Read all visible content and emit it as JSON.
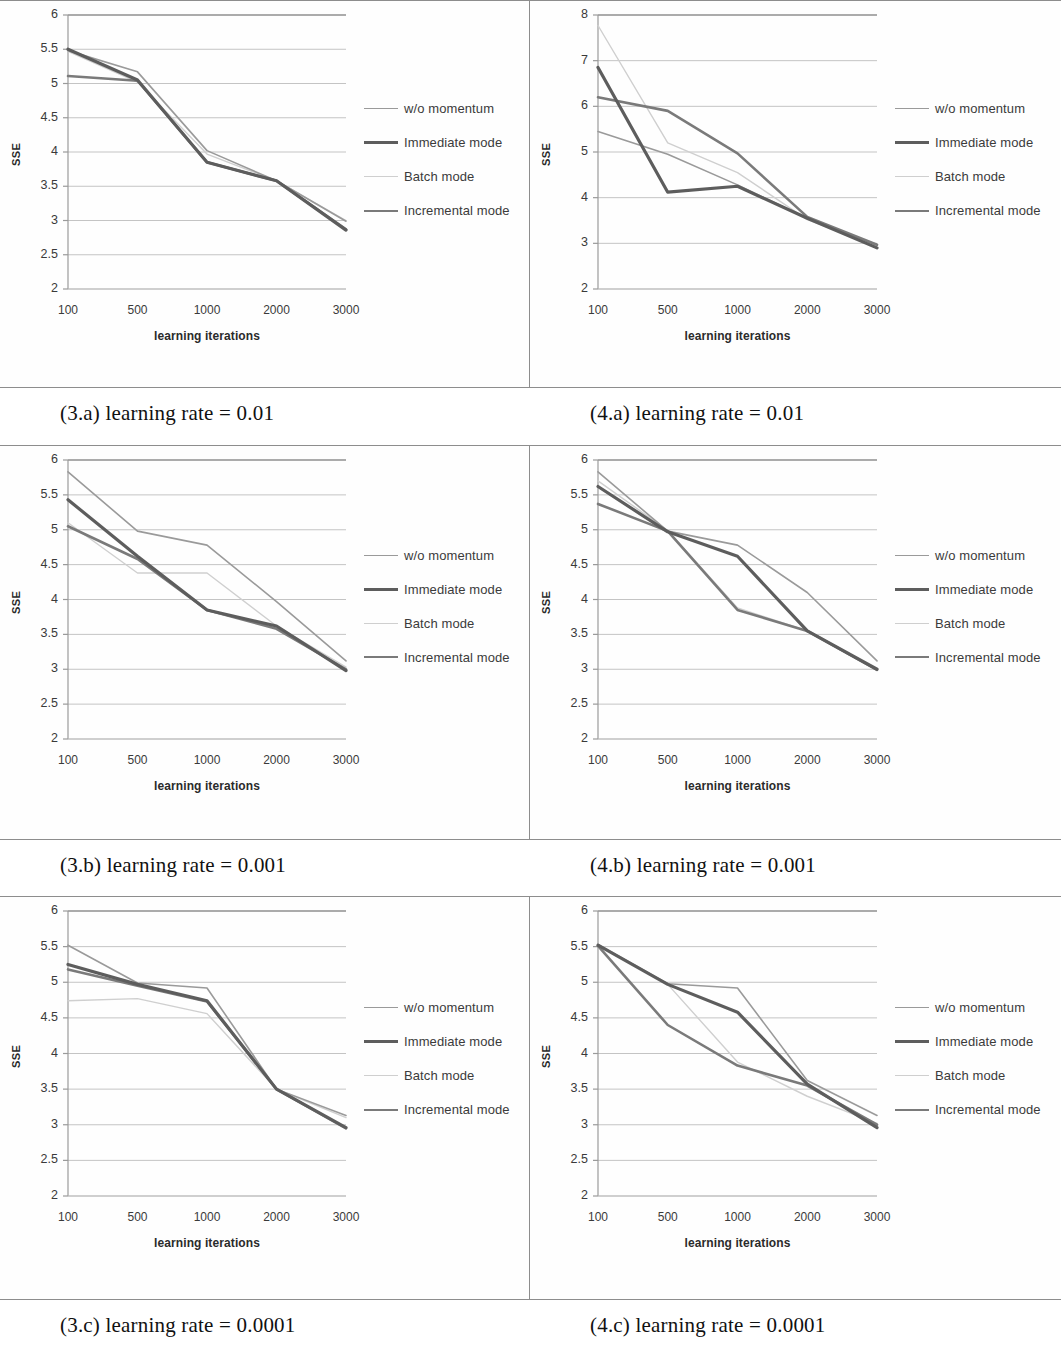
{
  "figure": {
    "series_defs": [
      {
        "key": "wo_momentum",
        "label": "w/o momentum",
        "color": "#9a9a9a",
        "width": 1.6,
        "dash": "none"
      },
      {
        "key": "immediate",
        "label": "Immediate mode",
        "color": "#5d5d5d",
        "width": 3.2,
        "dash": "none"
      },
      {
        "key": "batch",
        "label": "Batch mode",
        "color": "#cfcfcf",
        "width": 1.4,
        "dash": "none"
      },
      {
        "key": "incremental",
        "label": "Incremental mode",
        "color": "#7a7a7a",
        "width": 2.6,
        "dash": "none"
      }
    ],
    "axis": {
      "ylabel": "SSE",
      "xlabel": "learning iterations",
      "xticks": [
        "100",
        "500",
        "1000",
        "2000",
        "3000"
      ]
    }
  },
  "panels": [
    {
      "id": "3a",
      "caption": "(3.a) learning rate = 0.01",
      "chart_data": {
        "type": "line",
        "title": "",
        "xlabel": "learning iterations",
        "ylabel": "SSE",
        "categories": [
          "100",
          "500",
          "1000",
          "2000",
          "3000"
        ],
        "x": [
          100,
          500,
          1000,
          2000,
          3000
        ],
        "ylim": [
          2,
          6
        ],
        "ytick_labels": [
          "2",
          "2.5",
          "3",
          "3.5",
          "4",
          "4.5",
          "5",
          "5.5",
          "6"
        ],
        "yticks": [
          2,
          2.5,
          3,
          3.5,
          4,
          4.5,
          5,
          5.5,
          6
        ],
        "grid": true,
        "legend_position": "right",
        "series": [
          {
            "name": "w/o momentum",
            "values": [
              5.48,
              5.17,
              4.02,
              3.58,
              2.99
            ]
          },
          {
            "name": "Immediate mode",
            "values": [
              5.5,
              5.05,
              3.85,
              3.58,
              2.86
            ]
          },
          {
            "name": "Batch mode",
            "values": [
              5.47,
              5.02,
              3.97,
              3.58,
              3.0
            ]
          },
          {
            "name": "Incremental mode",
            "values": [
              5.11,
              5.04,
              3.85,
              3.58,
              2.87
            ]
          }
        ]
      }
    },
    {
      "id": "4a",
      "caption": "(4.a) learning rate = 0.01",
      "chart_data": {
        "type": "line",
        "title": "",
        "xlabel": "learning iterations",
        "ylabel": "SSE",
        "categories": [
          "100",
          "500",
          "1000",
          "2000",
          "3000"
        ],
        "x": [
          100,
          500,
          1000,
          2000,
          3000
        ],
        "ylim": [
          2,
          8
        ],
        "ytick_labels": [
          "2",
          "3",
          "4",
          "5",
          "6",
          "7",
          "8"
        ],
        "yticks": [
          2,
          3,
          4,
          5,
          6,
          7,
          8
        ],
        "grid": true,
        "legend_position": "right",
        "series": [
          {
            "name": "w/o momentum",
            "values": [
              5.45,
              4.95,
              4.28,
              3.55,
              2.97
            ]
          },
          {
            "name": "Immediate mode",
            "values": [
              6.85,
              4.12,
              4.25,
              3.55,
              2.9
            ]
          },
          {
            "name": "Batch mode",
            "values": [
              7.77,
              5.2,
              4.55,
              3.52,
              2.95
            ]
          },
          {
            "name": "Incremental mode",
            "values": [
              6.2,
              5.9,
              4.97,
              3.58,
              2.97
            ]
          }
        ]
      }
    },
    {
      "id": "3b",
      "caption": "(3.b) learning rate = 0.001",
      "chart_data": {
        "type": "line",
        "title": "",
        "xlabel": "learning iterations",
        "ylabel": "SSE",
        "categories": [
          "100",
          "500",
          "1000",
          "2000",
          "3000"
        ],
        "x": [
          100,
          500,
          1000,
          2000,
          3000
        ],
        "ylim": [
          2,
          6
        ],
        "ytick_labels": [
          "2",
          "2.5",
          "3",
          "3.5",
          "4",
          "4.5",
          "5",
          "5.5",
          "6"
        ],
        "yticks": [
          2,
          2.5,
          3,
          3.5,
          4,
          4.5,
          5,
          5.5,
          6
        ],
        "grid": true,
        "legend_position": "right",
        "series": [
          {
            "name": "w/o momentum",
            "values": [
              5.83,
              4.98,
              4.78,
              3.97,
              3.12
            ]
          },
          {
            "name": "Immediate mode",
            "values": [
              5.43,
              4.62,
              3.85,
              3.62,
              2.98
            ]
          },
          {
            "name": "Batch mode",
            "values": [
              5.1,
              4.38,
              4.38,
              3.62,
              3.03
            ]
          },
          {
            "name": "Incremental mode",
            "values": [
              5.05,
              4.58,
              3.85,
              3.58,
              3.0
            ]
          }
        ]
      }
    },
    {
      "id": "4b",
      "caption": "(4.b) learning rate = 0.001",
      "chart_data": {
        "type": "line",
        "title": "",
        "xlabel": "learning iterations",
        "ylabel": "SSE",
        "categories": [
          "100",
          "500",
          "1000",
          "2000",
          "3000"
        ],
        "x": [
          100,
          500,
          1000,
          2000,
          3000
        ],
        "ylim": [
          2,
          6
        ],
        "ytick_labels": [
          "2",
          "2.5",
          "3",
          "3.5",
          "4",
          "4.5",
          "5",
          "5.5",
          "6"
        ],
        "yticks": [
          2,
          2.5,
          3,
          3.5,
          4,
          4.5,
          5,
          5.5,
          6
        ],
        "grid": true,
        "legend_position": "right",
        "series": [
          {
            "name": "w/o momentum",
            "values": [
              5.83,
              4.98,
              4.78,
              4.1,
              3.12
            ]
          },
          {
            "name": "Immediate mode",
            "values": [
              5.62,
              4.97,
              4.62,
              3.55,
              3.0
            ]
          },
          {
            "name": "Batch mode",
            "values": [
              5.7,
              4.99,
              3.88,
              3.55,
              3.0
            ]
          },
          {
            "name": "Incremental mode",
            "values": [
              5.37,
              4.98,
              3.85,
              3.55,
              2.99
            ]
          }
        ]
      }
    },
    {
      "id": "3c",
      "caption": "(3.c) learning rate = 0.0001",
      "chart_data": {
        "type": "line",
        "title": "",
        "xlabel": "learning iterations",
        "ylabel": "SSE",
        "categories": [
          "100",
          "500",
          "1000",
          "2000",
          "3000"
        ],
        "x": [
          100,
          500,
          1000,
          2000,
          3000
        ],
        "ylim": [
          2,
          6
        ],
        "ytick_labels": [
          "2",
          "2.5",
          "3",
          "3.5",
          "4",
          "4.5",
          "5",
          "5.5",
          "6"
        ],
        "yticks": [
          2,
          2.5,
          3,
          3.5,
          4,
          4.5,
          5,
          5.5,
          6
        ],
        "grid": true,
        "legend_position": "right",
        "series": [
          {
            "name": "w/o momentum",
            "values": [
              5.52,
              4.99,
              4.92,
              3.5,
              3.13
            ]
          },
          {
            "name": "Immediate mode",
            "values": [
              5.25,
              4.97,
              4.74,
              3.5,
              2.96
            ]
          },
          {
            "name": "Batch mode",
            "values": [
              4.74,
              4.77,
              4.56,
              3.5,
              3.1
            ]
          },
          {
            "name": "Incremental mode",
            "values": [
              5.18,
              4.95,
              4.73,
              3.5,
              2.95
            ]
          }
        ]
      }
    },
    {
      "id": "4c",
      "caption": "(4.c) learning rate = 0.0001",
      "chart_data": {
        "type": "line",
        "title": "",
        "xlabel": "learning iterations",
        "ylabel": "SSE",
        "categories": [
          "100",
          "500",
          "1000",
          "2000",
          "3000"
        ],
        "x": [
          100,
          500,
          1000,
          2000,
          3000
        ],
        "ylim": [
          2,
          6
        ],
        "ytick_labels": [
          "2",
          "2.5",
          "3",
          "3.5",
          "4",
          "4.5",
          "5",
          "5.5",
          "6"
        ],
        "yticks": [
          2,
          2.5,
          3,
          3.5,
          4,
          4.5,
          5,
          5.5,
          6
        ],
        "grid": true,
        "legend_position": "right",
        "series": [
          {
            "name": "w/o momentum",
            "values": [
              5.53,
              4.98,
              4.92,
              3.62,
              3.13
            ]
          },
          {
            "name": "Immediate mode",
            "values": [
              5.52,
              4.97,
              4.58,
              3.57,
              2.96
            ]
          },
          {
            "name": "Batch mode",
            "values": [
              5.52,
              4.97,
              3.88,
              3.4,
              3.02
            ]
          },
          {
            "name": "Incremental mode",
            "values": [
              5.51,
              4.4,
              3.83,
              3.55,
              3.0
            ]
          }
        ]
      }
    }
  ]
}
